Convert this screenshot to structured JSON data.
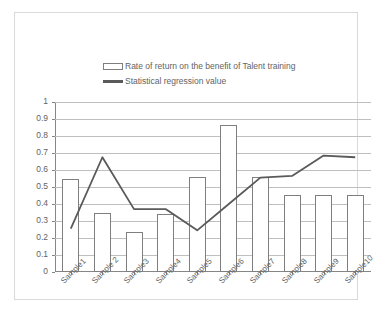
{
  "chart_data": {
    "type": "bar",
    "title": "",
    "xlabel": "",
    "ylabel": "",
    "ylim": [
      0,
      1
    ],
    "ytick_labels": [
      "1",
      "0.9",
      "0.8",
      "0.7",
      "0.6",
      "0.5",
      "0.4",
      "0.3",
      "0.2",
      "0.1",
      "0"
    ],
    "ytick_values": [
      1,
      0.9,
      0.8,
      0.7,
      0.6,
      0.5,
      0.4,
      0.3,
      0.2,
      0.1,
      0
    ],
    "grid": true,
    "legend_position": "top-center",
    "categories": [
      "Sample1",
      "Sample 2",
      "Sample3",
      "Sample4",
      "Sample5",
      "Sample6",
      "Sample7",
      "Sample8",
      "Sample9",
      "Sample10"
    ],
    "series": [
      {
        "name": "Rate of return on the benefit of Talent training",
        "type": "bar",
        "color": "#7f7f7f",
        "fill": "#ffffff",
        "values": [
          0.545,
          0.345,
          0.235,
          0.34,
          0.56,
          0.865,
          0.56,
          0.455,
          0.455,
          0.455
        ]
      },
      {
        "name": "Statistical regression value",
        "type": "line",
        "color": "#5a5a5a",
        "values": [
          0.255,
          0.675,
          0.37,
          0.37,
          0.245,
          0.4,
          0.555,
          0.565,
          0.685,
          0.675
        ]
      }
    ]
  },
  "legend": {
    "items": [
      {
        "label": "Rate of return on the benefit of Talent training",
        "marker": "bar-swatch"
      },
      {
        "label": "Statistical regression value",
        "marker": "line-swatch"
      }
    ]
  },
  "colors": {
    "gridline": "#bfbfbf",
    "axis": "#868686",
    "bar_outline": "#7f7f7f",
    "line": "#5a5a5a",
    "text": "#636363",
    "frame": "#d9d9d9",
    "background": "#ffffff"
  }
}
